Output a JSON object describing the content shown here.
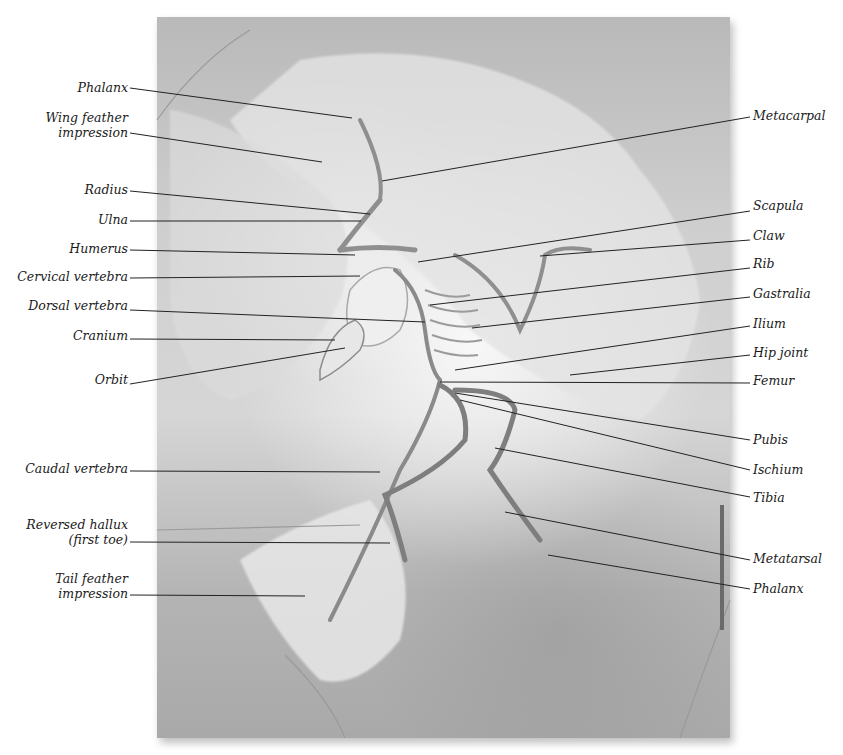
{
  "figure": {
    "colors": {
      "background": "#ffffff",
      "slab": "#c8c8c8",
      "bone": "#e9e9e9",
      "leader_line": "#222222",
      "label_text": "#1a1a1a"
    }
  },
  "labels_left": [
    {
      "id": "phalanx-wing",
      "line1": "Phalanx",
      "line2": ""
    },
    {
      "id": "wing-feather-impression",
      "line1": "Wing feather",
      "line2": "impression"
    },
    {
      "id": "radius",
      "line1": "Radius",
      "line2": ""
    },
    {
      "id": "ulna",
      "line1": "Ulna",
      "line2": ""
    },
    {
      "id": "humerus",
      "line1": "Humerus",
      "line2": ""
    },
    {
      "id": "cervical-vertebra",
      "line1": "Cervical vertebra",
      "line2": ""
    },
    {
      "id": "dorsal-vertebra",
      "line1": "Dorsal vertebra",
      "line2": ""
    },
    {
      "id": "cranium",
      "line1": "Cranium",
      "line2": ""
    },
    {
      "id": "orbit",
      "line1": "Orbit",
      "line2": ""
    },
    {
      "id": "caudal-vertebra",
      "line1": "Caudal vertebra",
      "line2": ""
    },
    {
      "id": "reversed-hallux",
      "line1": "Reversed hallux",
      "line2": "(first toe)"
    },
    {
      "id": "tail-feather-impression",
      "line1": "Tail feather",
      "line2": "impression"
    }
  ],
  "labels_right": [
    {
      "id": "metacarpal",
      "line1": "Metacarpal"
    },
    {
      "id": "scapula",
      "line1": "Scapula"
    },
    {
      "id": "claw",
      "line1": "Claw"
    },
    {
      "id": "rib",
      "line1": "Rib"
    },
    {
      "id": "gastralia",
      "line1": "Gastralia"
    },
    {
      "id": "ilium",
      "line1": "Ilium"
    },
    {
      "id": "hip-joint",
      "line1": "Hip joint"
    },
    {
      "id": "femur",
      "line1": "Femur"
    },
    {
      "id": "pubis",
      "line1": "Pubis"
    },
    {
      "id": "ischium",
      "line1": "Ischium"
    },
    {
      "id": "tibia",
      "line1": "Tibia"
    },
    {
      "id": "metatarsal",
      "line1": "Metatarsal"
    },
    {
      "id": "phalanx-foot",
      "line1": "Phalanx"
    }
  ]
}
